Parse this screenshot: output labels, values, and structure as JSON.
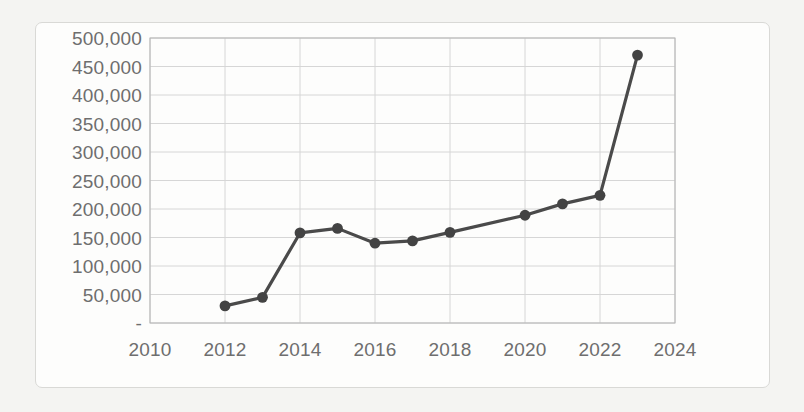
{
  "chart_data": {
    "type": "line",
    "title": "",
    "xlabel": "",
    "ylabel": "",
    "x": [
      2012,
      2013,
      2014,
      2015,
      2016,
      2017,
      2018,
      2020,
      2021,
      2022,
      2023
    ],
    "values": [
      30000,
      45000,
      158000,
      166000,
      140000,
      144000,
      159000,
      189000,
      209000,
      224000,
      470000
    ],
    "series": [
      {
        "name": "series-1",
        "x": [
          2012,
          2013,
          2014,
          2015,
          2016,
          2017,
          2018,
          2020,
          2021,
          2022,
          2023
        ],
        "values": [
          30000,
          45000,
          158000,
          166000,
          140000,
          144000,
          159000,
          189000,
          209000,
          224000,
          470000
        ]
      }
    ],
    "xlim": [
      2010,
      2024
    ],
    "ylim": [
      0,
      500000
    ],
    "xticks": [
      2010,
      2012,
      2014,
      2016,
      2018,
      2020,
      2022,
      2024
    ],
    "xtick_labels": [
      "2010",
      "2012",
      "2014",
      "2016",
      "2018",
      "2020",
      "2022",
      "2024"
    ],
    "yticks": [
      0,
      50000,
      100000,
      150000,
      200000,
      250000,
      300000,
      350000,
      400000,
      450000,
      500000
    ],
    "ytick_labels": [
      "-",
      "50,000",
      "100,000",
      "150,000",
      "200,000",
      "250,000",
      "300,000",
      "350,000",
      "400,000",
      "450,000",
      "500,000"
    ],
    "grid": true,
    "grid_axes": "both",
    "legend": false,
    "legend_position": "none",
    "marker": "circle",
    "colors": {
      "line": "#4a4a4a",
      "marker": "#434343",
      "grid": "#d6d6d6",
      "axis": "#b4b4b4",
      "tick_text": "#6e6e6e",
      "plot_background": "#fdfdfc",
      "page_background": "#f4f4f2",
      "card_border": "#d9d9d6"
    }
  }
}
